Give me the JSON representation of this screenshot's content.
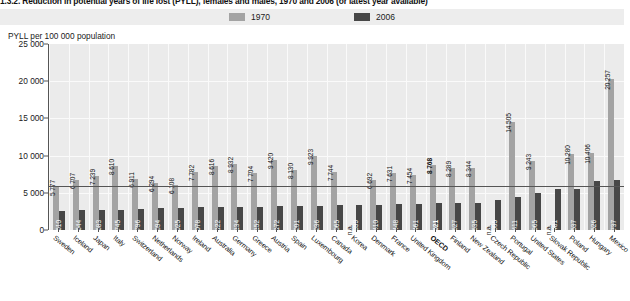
{
  "figure": {
    "title": "1.3.2. Reduction in potential years of life lost (PYLL), females and males, 1970 and 2006 (or latest year available)",
    "axis_title": "PYLL per 100 000 population"
  },
  "legend": {
    "position": "top-center",
    "items": [
      {
        "label": "1970",
        "color": "#a3a3a3"
      },
      {
        "label": "2006",
        "color": "#474747"
      }
    ]
  },
  "chart_data": {
    "type": "bar",
    "title": "1.3.2. Reduction in potential years of life lost (PYLL), females and males, 1970 and 2006 (or latest year available)",
    "xlabel": "",
    "ylabel": "PYLL per 100 000 population",
    "ylim": [
      0,
      25000
    ],
    "yticks": [
      "0",
      "5 000",
      "10 000",
      "15 000",
      "20 000",
      "25 000"
    ],
    "ytick_values": [
      0,
      5000,
      10000,
      15000,
      20000,
      25000
    ],
    "grid": true,
    "legend_position": "top-center",
    "categories": [
      "Sweden",
      "Iceland",
      "Japan",
      "Italy",
      "Switzerland",
      "Netherlands",
      "Norway",
      "Ireland",
      "Australia",
      "Germany",
      "Greece",
      "Austria",
      "Spain",
      "Luxembourg",
      "Canada",
      "Korea",
      "Denmark",
      "France",
      "United Kingdom",
      "OECD",
      "Finland",
      "New Zealand",
      "Czech Republic",
      "Portugal",
      "United States",
      "Slovak Republic",
      "Poland",
      "Hungary",
      "Mexico"
    ],
    "highlight_category": "OECD",
    "series": [
      {
        "name": "1970",
        "color": "#a3a3a3",
        "values": [
          5777,
          6707,
          7239,
          8610,
          6911,
          6294,
          6108,
          7782,
          8616,
          8932,
          7704,
          9420,
          8130,
          9923,
          7744,
          null,
          6692,
          7631,
          7454,
          8768,
          8289,
          8344,
          null,
          14505,
          9243,
          null,
          10280,
          10406,
          20257
        ],
        "labels": [
          "5 777",
          "6 707",
          "7 239",
          "8 610",
          "6 911",
          "6 294",
          "6 108",
          "7 782",
          "8 616",
          "8 932",
          "7 704",
          "9 420",
          "8 130",
          "9 923",
          "7 744",
          "n.a.",
          "6 692",
          "7 631",
          "7 454",
          "8 768",
          "8 289",
          "8 344",
          "n.a.",
          "14 505",
          "9 243",
          "n.a.",
          "10 280",
          "10 406",
          "20 257"
        ]
      },
      {
        "name": "2006",
        "color": "#474747",
        "values": [
          2610,
          2644,
          2683,
          2745,
          2796,
          2894,
          2925,
          3078,
          3122,
          3134,
          3152,
          3172,
          3201,
          3236,
          3365,
          3399,
          3410,
          3448,
          3461,
          3621,
          3627,
          3635,
          4005,
          4411,
          4965,
          5481,
          5537,
          6526,
          6737
        ],
        "labels": [
          "2 610",
          "2 644",
          "2 683",
          "2 745",
          "2 796",
          "2 894",
          "2 925",
          "3 078",
          "3 122",
          "3 134",
          "3 152",
          "3 172",
          "3 201",
          "3 236",
          "3 365",
          "3 399",
          "3 410",
          "3 448",
          "3 461",
          "3 621",
          "3 627",
          "3 635",
          "4 005",
          "4 411",
          "4 965",
          "5 481",
          "5 537",
          "6 526",
          "6 737"
        ]
      }
    ]
  }
}
